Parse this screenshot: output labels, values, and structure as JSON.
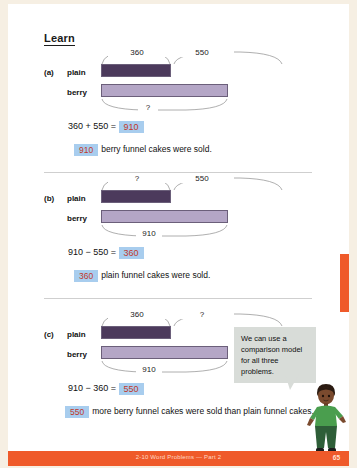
{
  "header": {
    "title": "Learn"
  },
  "problems": [
    {
      "letter": "(a)",
      "plain_label": "plain",
      "berry_label": "berry",
      "top_left_value": "360",
      "top_right_value": "550",
      "bottom_value": "?",
      "equation_left": "360 + 550 = ",
      "equation_answer": "910",
      "sentence_answer": "910",
      "sentence_text": "berry funnel cakes were sold."
    },
    {
      "letter": "(b)",
      "plain_label": "plain",
      "berry_label": "berry",
      "top_left_value": "?",
      "top_right_value": "550",
      "bottom_value": "910",
      "equation_left": "910 − 550 = ",
      "equation_answer": "360",
      "sentence_answer": "360",
      "sentence_text": "plain funnel cakes were sold."
    },
    {
      "letter": "(c)",
      "plain_label": "plain",
      "berry_label": "berry",
      "top_left_value": "360",
      "top_right_value": "?",
      "bottom_value": "910",
      "equation_left": "910 − 360 = ",
      "equation_answer": "550",
      "sentence_answer": "550",
      "sentence_text": "more berry funnel cakes were sold than plain funnel cakes."
    }
  ],
  "speech_bubble": {
    "text": "We can use a comparison model for all three problems."
  },
  "footer": {
    "text": "2-10  Word Problems — Part 2",
    "page": "65"
  },
  "colors": {
    "bar_plain": "#4c3a5c",
    "bar_berry": "#b4a6c6",
    "answer_highlight": "#a8cdee",
    "answer_text": "#c0392b",
    "footer_bar": "#ef5a2a",
    "bubble": "#d8dcd8"
  }
}
